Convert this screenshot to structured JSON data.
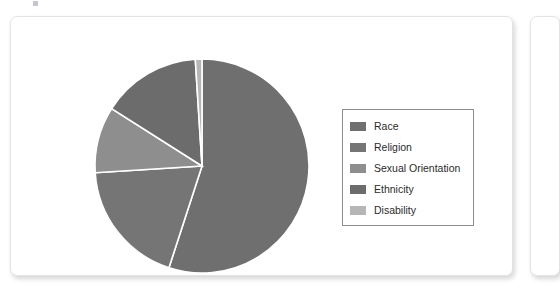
{
  "chart_data": {
    "type": "pie",
    "title": "",
    "legend_position": "right",
    "categories": [
      "Race",
      "Religion",
      "Sexual Orientation",
      "Ethnicity",
      "Disability"
    ],
    "values": [
      55,
      19,
      10,
      15,
      1
    ],
    "units": "percent",
    "colors": [
      "#6f6f6f",
      "#757575",
      "#8e8e8e",
      "#6c6c6c",
      "#b6b6b6"
    ],
    "slice_order_clockwise_from_top": [
      "Race",
      "Religion",
      "Sexual Orientation",
      "Ethnicity",
      "Disability"
    ],
    "slices": [
      {
        "label": "Race",
        "value": 55,
        "color": "#6f6f6f",
        "start_angle": 0,
        "end_angle": 198
      },
      {
        "label": "Religion",
        "value": 19,
        "color": "#757575",
        "start_angle": 198,
        "end_angle": 266.4
      },
      {
        "label": "Sexual Orientation",
        "value": 10,
        "color": "#8e8e8e",
        "start_angle": 266.4,
        "end_angle": 302.4
      },
      {
        "label": "Ethnicity",
        "value": 15,
        "color": "#6c6c6c",
        "start_angle": 302.4,
        "end_angle": 356.4
      },
      {
        "label": "Disability",
        "value": 1,
        "color": "#b6b6b6",
        "start_angle": 356.4,
        "end_angle": 360
      }
    ],
    "geometry": {
      "center_x": 116,
      "center_y": 116,
      "radius": 107,
      "separator_color": "#ffffff",
      "separator_width": 1.6
    }
  },
  "legend": {
    "items": [
      {
        "label": "Race",
        "color": "#6f6f6f"
      },
      {
        "label": "Religion",
        "color": "#757575"
      },
      {
        "label": "Sexual Orientation",
        "color": "#8e8e8e"
      },
      {
        "label": "Ethnicity",
        "color": "#6c6c6c"
      },
      {
        "label": "Disability",
        "color": "#b6b6b6"
      }
    ]
  }
}
